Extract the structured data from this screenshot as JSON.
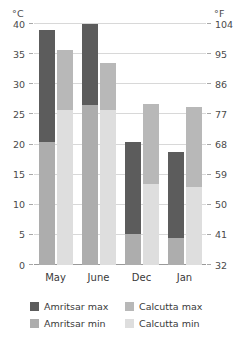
{
  "chart_data": {
    "type": "bar",
    "title": "",
    "subtitle": "",
    "categories": [
      "May",
      "June",
      "Dec",
      "Jan"
    ],
    "series": [
      {
        "name": "Amritsar max",
        "color": "#5c5c5c",
        "values": [
          39.0,
          40.0,
          20.5,
          18.7
        ]
      },
      {
        "name": "Amritsar min",
        "color": "#adadad",
        "values": [
          20.5,
          26.5,
          5.1,
          4.5
        ]
      },
      {
        "name": "Calcutta max",
        "color": "#b8b8b8",
        "values": [
          35.7,
          33.5,
          26.8,
          26.3
        ]
      },
      {
        "name": "Calcutta min",
        "color": "#dedede",
        "values": [
          25.7,
          25.7,
          13.5,
          13.0
        ]
      }
    ],
    "xlabel": "",
    "ylabel": "",
    "left_axis": {
      "unit": "°C",
      "ticks": [
        0,
        5,
        10,
        15,
        20,
        25,
        30,
        35,
        40
      ],
      "min": 0,
      "max": 40
    },
    "right_axis": {
      "unit": "°F",
      "ticks": [
        32,
        41,
        50,
        59,
        68,
        77,
        86,
        95,
        104
      ],
      "min": 32,
      "max": 104
    },
    "ylim": [
      0,
      40
    ],
    "grid": true,
    "legend_position": "bottom",
    "legend_entries": [
      "Amritsar max",
      "Calcutta max",
      "Amritsar min",
      "Calcutta min"
    ]
  },
  "colors": {
    "amritsar_max": "#5c5c5c",
    "amritsar_min": "#adadad",
    "calcutta_max": "#b8b8b8",
    "calcutta_min": "#dedede",
    "gridline": "#d8d8d8",
    "baseline": "#9a9a9a",
    "text": "#3a3a3a",
    "background": "#ffffff"
  }
}
